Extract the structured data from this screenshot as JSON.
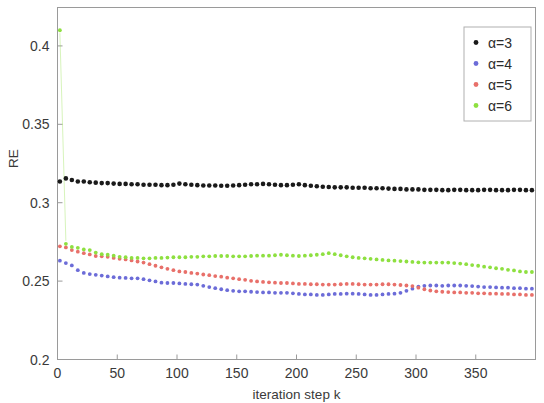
{
  "chart_data": {
    "type": "scatter",
    "title": "",
    "xlabel": "iteration step k",
    "ylabel": "RE",
    "xlim": [
      0,
      400
    ],
    "ylim": [
      0.2,
      0.4245
    ],
    "xticks": [
      0,
      50,
      100,
      150,
      200,
      250,
      300,
      350
    ],
    "yticks": [
      0.2,
      0.25,
      0.3,
      0.35,
      0.4
    ],
    "xticklabels": [
      "0",
      "50",
      "100",
      "150",
      "200",
      "250",
      "300",
      "350"
    ],
    "yticklabels": [
      "0.2",
      "0.25",
      "0.3",
      "0.35",
      "0.4"
    ],
    "grid": false,
    "legend_position": "top-right",
    "marker": "dot",
    "x": [
      2,
      7,
      12,
      17,
      22,
      27,
      32,
      37,
      42,
      47,
      52,
      57,
      62,
      67,
      72,
      77,
      82,
      87,
      92,
      97,
      102,
      107,
      112,
      117,
      122,
      127,
      132,
      137,
      142,
      147,
      152,
      157,
      162,
      167,
      172,
      177,
      182,
      187,
      192,
      197,
      202,
      207,
      212,
      217,
      222,
      227,
      232,
      237,
      242,
      247,
      252,
      257,
      262,
      267,
      272,
      277,
      282,
      287,
      292,
      297,
      302,
      307,
      312,
      317,
      322,
      327,
      332,
      337,
      342,
      347,
      352,
      357,
      362,
      367,
      372,
      377,
      382,
      387,
      392,
      397
    ],
    "series": [
      {
        "name": "α=3",
        "label": "α=3",
        "color": "#1a1a1a",
        "values": [
          0.3135,
          0.3155,
          0.3145,
          0.3135,
          0.3135,
          0.313,
          0.3128,
          0.3125,
          0.3125,
          0.3122,
          0.312,
          0.312,
          0.3118,
          0.3118,
          0.3115,
          0.3115,
          0.3115,
          0.3112,
          0.3112,
          0.3115,
          0.3122,
          0.3118,
          0.3115,
          0.3112,
          0.311,
          0.311,
          0.311,
          0.3108,
          0.3108,
          0.311,
          0.3112,
          0.3115,
          0.3118,
          0.3118,
          0.312,
          0.3118,
          0.3115,
          0.3112,
          0.3112,
          0.3115,
          0.3118,
          0.3112,
          0.3108,
          0.3105,
          0.3102,
          0.31,
          0.3098,
          0.3098,
          0.3098,
          0.3095,
          0.3095,
          0.3095,
          0.3092,
          0.3092,
          0.3092,
          0.309,
          0.3088,
          0.3088,
          0.3085,
          0.3085,
          0.3085,
          0.3082,
          0.3082,
          0.3082,
          0.308,
          0.308,
          0.3082,
          0.3082,
          0.308,
          0.308,
          0.308,
          0.3082,
          0.3082,
          0.308,
          0.308,
          0.308,
          0.3082,
          0.3082,
          0.308,
          0.308
        ]
      },
      {
        "name": "α=4",
        "label": "α=4",
        "color": "#6c6cd8",
        "values": [
          0.263,
          0.2615,
          0.26,
          0.257,
          0.2552,
          0.2545,
          0.254,
          0.2535,
          0.253,
          0.2525,
          0.2522,
          0.252,
          0.2518,
          0.2518,
          0.2512,
          0.2505,
          0.2498,
          0.249,
          0.2488,
          0.2488,
          0.2485,
          0.2482,
          0.248,
          0.2478,
          0.247,
          0.2462,
          0.2455,
          0.2448,
          0.2442,
          0.2438,
          0.2435,
          0.2435,
          0.2432,
          0.243,
          0.2428,
          0.2428,
          0.2425,
          0.2425,
          0.2425,
          0.2422,
          0.2418,
          0.2415,
          0.2415,
          0.2412,
          0.2412,
          0.2415,
          0.2418,
          0.2418,
          0.242,
          0.242,
          0.2418,
          0.2415,
          0.2412,
          0.2412,
          0.2415,
          0.2418,
          0.242,
          0.2425,
          0.2438,
          0.2452,
          0.2465,
          0.247,
          0.2472,
          0.2472,
          0.247,
          0.2472,
          0.2472,
          0.2472,
          0.247,
          0.2468,
          0.2465,
          0.2462,
          0.2462,
          0.246,
          0.2458,
          0.2458,
          0.2455,
          0.2455,
          0.2452,
          0.2452
        ]
      },
      {
        "name": "α=5",
        "label": "α=5",
        "color": "#e8706a",
        "values": [
          0.2722,
          0.2715,
          0.2698,
          0.2688,
          0.2678,
          0.267,
          0.266,
          0.2658,
          0.2655,
          0.2648,
          0.2642,
          0.2638,
          0.2632,
          0.2625,
          0.2618,
          0.2608,
          0.2598,
          0.2588,
          0.2578,
          0.257,
          0.2562,
          0.2558,
          0.2552,
          0.2548,
          0.2542,
          0.2538,
          0.2532,
          0.2528,
          0.2522,
          0.2518,
          0.2512,
          0.2508,
          0.2502,
          0.2498,
          0.2495,
          0.2492,
          0.249,
          0.2488,
          0.2488,
          0.2485,
          0.2482,
          0.2482,
          0.248,
          0.248,
          0.2478,
          0.2478,
          0.2478,
          0.248,
          0.2482,
          0.2482,
          0.248,
          0.2478,
          0.2478,
          0.2478,
          0.248,
          0.248,
          0.2478,
          0.2475,
          0.2472,
          0.2468,
          0.2458,
          0.2448,
          0.244,
          0.2435,
          0.2432,
          0.243,
          0.2428,
          0.2428,
          0.2425,
          0.2425,
          0.2422,
          0.2422,
          0.242,
          0.242,
          0.2418,
          0.2418,
          0.2415,
          0.2415,
          0.2412,
          0.2412
        ]
      },
      {
        "name": "α=6",
        "label": "α=6",
        "color": "#8ee040",
        "values": [
          0.41,
          0.2738,
          0.2718,
          0.2712,
          0.2702,
          0.2698,
          0.2682,
          0.2672,
          0.2668,
          0.2662,
          0.2655,
          0.2652,
          0.2648,
          0.2648,
          0.2645,
          0.2645,
          0.2648,
          0.2648,
          0.265,
          0.2652,
          0.2652,
          0.2652,
          0.2655,
          0.2655,
          0.2658,
          0.2658,
          0.266,
          0.266,
          0.266,
          0.2658,
          0.2658,
          0.2658,
          0.266,
          0.2662,
          0.2662,
          0.2662,
          0.2665,
          0.2668,
          0.2665,
          0.2662,
          0.266,
          0.2662,
          0.2665,
          0.2668,
          0.2672,
          0.2678,
          0.2672,
          0.2665,
          0.2658,
          0.2652,
          0.2648,
          0.2645,
          0.2642,
          0.2638,
          0.2635,
          0.2632,
          0.263,
          0.2628,
          0.2625,
          0.2622,
          0.262,
          0.2618,
          0.2618,
          0.2618,
          0.2618,
          0.2618,
          0.2615,
          0.2612,
          0.2608,
          0.2602,
          0.2598,
          0.2592,
          0.2588,
          0.2582,
          0.2578,
          0.2572,
          0.2568,
          0.2562,
          0.2558,
          0.2558
        ]
      }
    ]
  }
}
